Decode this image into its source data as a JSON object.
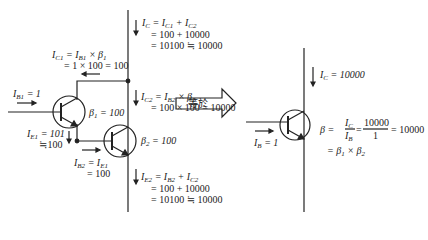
{
  "left_circuit": {
    "ic_total": {
      "line1": "I_C = I_C1 + I_C2",
      "line2": "= 100 + 10000",
      "line3": "= 10100 ≒ 10000"
    },
    "ic1": {
      "line1": "I_C1 = I_B1 × β_1",
      "line2": "= 1 × 100 = 100"
    },
    "ib1": "I_B1 = 1",
    "beta1": "β_1 = 100",
    "ie1": {
      "line1": "I_E1 = 101",
      "line2": "≒100"
    },
    "ic2": {
      "line1": "I_C2 = I_B2 × β_2",
      "line2": "= 100 × 100 = 10000"
    },
    "beta2": "β_2 = 100",
    "ib2": {
      "line1": "I_B2 = I_E1",
      "line2": "= 100"
    },
    "ie2": {
      "line1": "I_E2 = I_B2 + I_C2",
      "line2": "= 100 + 10000",
      "line3": "= 10100 ≒ 10000"
    }
  },
  "arrow": {
    "label": "等於"
  },
  "right_circuit": {
    "ic": "I_C = 10000",
    "ib": "I_B = 1",
    "beta": {
      "line1": "β = I_C / I_B = 10000 / 1 = 10000",
      "line2": "= β_1 × β_2",
      "num1": "I_C",
      "den1": "I_B",
      "num2": "10000",
      "den2": "1",
      "result": "= 10000"
    }
  }
}
